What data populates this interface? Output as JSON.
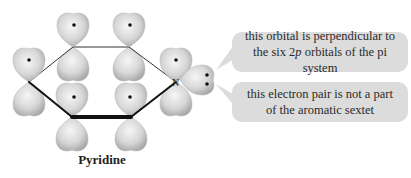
{
  "diagram": {
    "title": "Pyridine",
    "molecule": {
      "name": "Pyridine",
      "heteroatom_label": "N",
      "ring_atoms": [
        {
          "id": "C-left",
          "x": 29,
          "y": 82,
          "p_orbital_electrons": 1
        },
        {
          "id": "C-top-left",
          "x": 73,
          "y": 47,
          "p_orbital_electrons": 1
        },
        {
          "id": "C-top-right",
          "x": 129,
          "y": 47,
          "p_orbital_electrons": 1
        },
        {
          "id": "N",
          "x": 176,
          "y": 82,
          "p_orbital_electrons": 1
        },
        {
          "id": "C-bottom-right",
          "x": 131,
          "y": 117,
          "p_orbital_electrons": 1
        },
        {
          "id": "C-bottom-left",
          "x": 72,
          "y": 117,
          "p_orbital_electrons": 1
        }
      ],
      "lone_pair_electrons": 2
    },
    "callouts": [
      {
        "id": "perpendicular-orbital",
        "line1": "this orbital is perpendicular to",
        "line2_pre": "the six 2",
        "line2_italic": "p",
        "line2_post": " orbitals of the pi system"
      },
      {
        "id": "lone-pair",
        "line1": "this electron pair is not a part",
        "line2": "of the aromatic sextet"
      }
    ],
    "colors": {
      "orbital_fill_light": "#f4f4f4",
      "orbital_fill_dark": "#a9a9a9",
      "callout_bg": "#dcdcdc",
      "bond": "#111111",
      "text": "#2a2a2a"
    }
  }
}
